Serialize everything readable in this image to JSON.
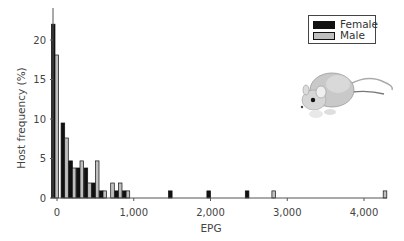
{
  "chart_data": {
    "type": "bar",
    "title": "",
    "xlabel": "EPG",
    "ylabel": "Host frequency (%)",
    "xlim": [
      0,
      4300
    ],
    "ylim": [
      0,
      24
    ],
    "x_ticks": [
      0,
      1000,
      2000,
      3000,
      4000
    ],
    "x_tick_labels": [
      "0",
      "1,000",
      "2,000",
      "3,000",
      "4,000"
    ],
    "y_ticks": [
      0,
      5,
      10,
      15,
      20
    ],
    "y_tick_labels": [
      "0",
      "5",
      "10",
      "15",
      "20"
    ],
    "grid": false,
    "legend_position": "upper right",
    "bin_width": 100,
    "categories": [
      0,
      100,
      200,
      300,
      400,
      500,
      600,
      700,
      800,
      900,
      1500,
      2000,
      2500,
      2800,
      4250
    ],
    "series": [
      {
        "name": "Female",
        "color": "#111111",
        "values": [
          22.0,
          9.5,
          4.7,
          3.8,
          3.8,
          1.9,
          0.9,
          0,
          0.9,
          0.9,
          0.9,
          0.9,
          0.9,
          0,
          0
        ]
      },
      {
        "name": "Male",
        "color": "#bfbfbf",
        "values": [
          18.1,
          7.6,
          3.8,
          4.7,
          1.9,
          4.7,
          0.9,
          1.9,
          1.9,
          0.9,
          0,
          0,
          0,
          0.9,
          0.9
        ]
      }
    ],
    "annotations": [
      "mouse illustration"
    ]
  },
  "legend": {
    "items": [
      {
        "label": "Female",
        "color": "#111111"
      },
      {
        "label": "Male",
        "color": "#bfbfbf"
      }
    ]
  }
}
